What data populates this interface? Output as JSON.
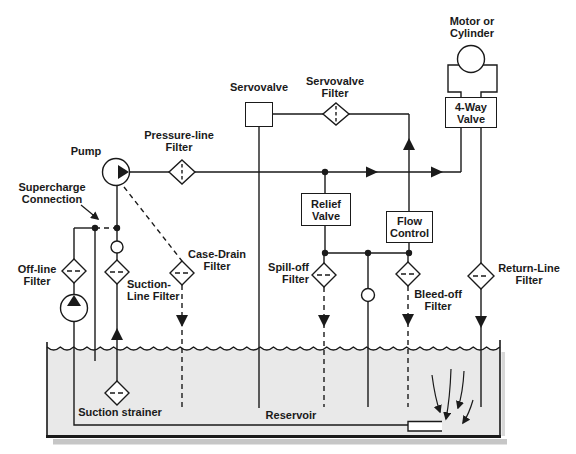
{
  "diagram": {
    "colors": {
      "ink": "#1a1a1a",
      "background": "#ffffff",
      "reservoir_fluid": "#e9e9e9",
      "tank_shadow": "#c6c6c6"
    },
    "labels": {
      "pump": "Pump",
      "pressure_line_filter": [
        "Pressure-line",
        "Filter"
      ],
      "servovalve": "Servovalve",
      "servovalve_filter": [
        "Servovalve",
        "Filter"
      ],
      "motor_or_cylinder": [
        "Motor or",
        "Cylinder"
      ],
      "four_way_valve": [
        "4-Way",
        "Valve"
      ],
      "relief_valve": [
        "Relief",
        "Valve"
      ],
      "flow_control": [
        "Flow",
        "Control"
      ],
      "supercharge_connection": [
        "Supercharge",
        "Connection"
      ],
      "off_line_filter": [
        "Off-line",
        "Filter"
      ],
      "suction_line_filter": [
        "Suction-",
        "Line Filter"
      ],
      "case_drain_filter": [
        "Case-Drain",
        "Filter"
      ],
      "spill_off_filter": [
        "Spill-off",
        "Filter"
      ],
      "bleed_off_filter": [
        "Bleed-off",
        "Filter"
      ],
      "return_line_filter": [
        "Return-Line",
        "Filter"
      ],
      "suction_strainer": "Suction strainer",
      "reservoir": "Reservoir"
    }
  }
}
